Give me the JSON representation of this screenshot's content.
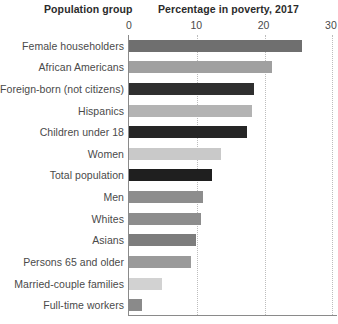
{
  "headers": {
    "group_header": "Population group",
    "value_header": "Percentage in poverty, 2017"
  },
  "axis": {
    "ticks": [
      "0",
      "10",
      "20",
      "30"
    ],
    "min": 0,
    "max": 30,
    "gridlines": true
  },
  "chart_data": {
    "type": "bar",
    "orientation": "horizontal",
    "title": "Percentage in poverty, 2017",
    "xlabel": "Percentage in poverty, 2017",
    "ylabel": "Population group",
    "xlim": [
      0,
      30
    ],
    "xticks": [
      0,
      10,
      20,
      30
    ],
    "grid": true,
    "legend": "none",
    "categories": [
      "Female householders",
      "African Americans",
      "Foreign-born (not citizens)",
      "Hispanics",
      "Children under 18",
      "Women",
      "Total population",
      "Men",
      "Whites",
      "Asians",
      "Persons 65 and older",
      "Married-couple families",
      "Full-time workers"
    ],
    "values": [
      25.7,
      21.2,
      18.5,
      18.3,
      17.5,
      13.6,
      12.3,
      11.0,
      10.7,
      10.0,
      9.2,
      4.9,
      2.0
    ],
    "bar_colors": [
      "#6f6f6f",
      "#a0a0a0",
      "#2f2f2f",
      "#b3b3b3",
      "#262626",
      "#c9c9c9",
      "#1f1f1f",
      "#8d8d8d",
      "#8d8d8d",
      "#7d7d7d",
      "#9a9a9a",
      "#d2d2d2",
      "#8a8a8a"
    ]
  },
  "colors": {
    "axis": "#8a8a8a",
    "gridline": "#bdbdbd",
    "text": "#4a4a4a",
    "header_text": "#2b2b2b",
    "background": "#ffffff"
  }
}
